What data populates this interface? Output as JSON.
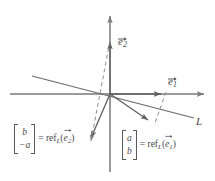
{
  "figure": {
    "colors": {
      "axis": "#7a7a7a",
      "vector": "#5f5f5f",
      "dashed": "#8a8a8a",
      "text": "#4a4a4a",
      "background": "#ffffff"
    },
    "axes": {
      "x_axis_name": "x-axis",
      "y_axis_name": "y-axis",
      "origin": {
        "x": 110,
        "y": 94
      }
    },
    "line": {
      "label": "L",
      "from": {
        "x": 32,
        "y": 76
      },
      "to": {
        "x": 194,
        "y": 118
      }
    },
    "vectors": [
      {
        "id": "e1",
        "label_base": "e",
        "label_sub": "1",
        "tip": {
          "x": 165,
          "y": 94
        },
        "style": "solid"
      },
      {
        "id": "e2",
        "label_base": "e",
        "label_sub": "2",
        "tip": {
          "x": 110,
          "y": 38
        },
        "style": "solid"
      },
      {
        "id": "refl_e1",
        "tip": {
          "x": 152,
          "y": 123
        },
        "style": "solid"
      },
      {
        "id": "refl_e2",
        "tip": {
          "x": 88,
          "y": 141
        },
        "style": "solid"
      }
    ],
    "dashed_lines": [
      {
        "id": "dash-e2-to-refl-e2",
        "from": {
          "x": 110,
          "y": 40
        },
        "to": {
          "x": 92,
          "y": 145
        }
      },
      {
        "id": "dash-e1-perp",
        "from": {
          "x": 165,
          "y": 95
        },
        "to": {
          "x": 154,
          "y": 124
        }
      }
    ],
    "labels": {
      "e1": {
        "base": "e",
        "sub": "1"
      },
      "e2": {
        "base": "e",
        "sub": "2"
      },
      "line_L": "L"
    },
    "equations": [
      {
        "id": "refl-e2-equation",
        "matrix_top": "b",
        "matrix_bottom": "−a",
        "equals": "=",
        "function_name": "ref",
        "function_sub": "L",
        "open_paren": "(",
        "arg_base": "e",
        "arg_sub": "2",
        "close_paren": ")"
      },
      {
        "id": "refl-e1-equation",
        "matrix_top": "a",
        "matrix_bottom": "b",
        "equals": "=",
        "function_name": "ref",
        "function_sub": "L",
        "open_paren": "(",
        "arg_base": "e",
        "arg_sub": "1",
        "close_paren": ")"
      }
    ]
  }
}
